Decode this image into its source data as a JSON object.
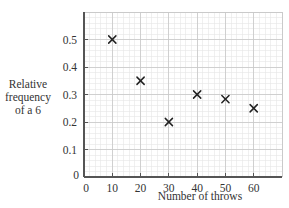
{
  "chart_data": {
    "type": "scatter",
    "title": "",
    "xlabel": "Number of throws",
    "ylabel_lines": [
      "Relative",
      "frequency",
      "of a 6"
    ],
    "ylabel": "Relative frequency of a 6",
    "xlim": [
      0,
      70
    ],
    "ylim": [
      0,
      0.6
    ],
    "x_ticks": [
      0,
      10,
      20,
      30,
      40,
      50,
      60
    ],
    "y_ticks": [
      0,
      0.1,
      0.2,
      0.3,
      0.4,
      0.5
    ],
    "x_tick_labels": [
      "0",
      "10",
      "20",
      "30",
      "40",
      "50",
      "60"
    ],
    "y_tick_labels": [
      "0",
      "0.1",
      "0.2",
      "0.3",
      "0.4",
      "0.5"
    ],
    "grid": true,
    "marker": "x",
    "x": [
      10,
      20,
      30,
      40,
      50,
      60
    ],
    "y": [
      0.5,
      0.35,
      0.2,
      0.3,
      0.283,
      0.25
    ],
    "points": [
      {
        "x": 10,
        "y": 0.5
      },
      {
        "x": 20,
        "y": 0.35
      },
      {
        "x": 30,
        "y": 0.2
      },
      {
        "x": 40,
        "y": 0.3
      },
      {
        "x": 50,
        "y": 0.283
      },
      {
        "x": 60,
        "y": 0.25
      }
    ],
    "legend": null
  },
  "colors": {
    "axis": "#555555",
    "major_grid": "#c8c8c8",
    "minor_grid": "#e6e6e6",
    "marker": "#222222",
    "text": "#333333"
  }
}
